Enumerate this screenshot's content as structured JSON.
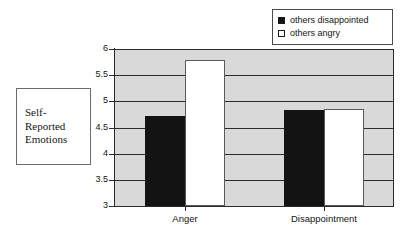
{
  "axis_title": {
    "text": "Self-\nReported\nEmotions"
  },
  "legend": {
    "items": [
      {
        "label": "others disappointed",
        "swatch": "filled-square-icon",
        "color": "#131313"
      },
      {
        "label": "others angry",
        "swatch": "hollow-square-icon",
        "color": "#ffffff"
      }
    ]
  },
  "colors": {
    "plot_background": "#d9d9d9",
    "axis": "#2b2b2b",
    "series_dark": "#131313",
    "series_light": "#ffffff",
    "page_background": "#ffffff"
  },
  "chart_data": {
    "type": "bar",
    "title": "",
    "xlabel": "",
    "ylabel": "Self-Reported Emotions",
    "categories": [
      "Anger",
      "Disappointment"
    ],
    "series": [
      {
        "name": "others disappointed",
        "values": [
          4.72,
          4.84
        ]
      },
      {
        "name": "others angry",
        "values": [
          5.79,
          4.86
        ]
      }
    ],
    "ylim": [
      3,
      6
    ],
    "yticks": [
      "3",
      "3.5",
      "4",
      "4.5",
      "5",
      "5.5",
      "6"
    ],
    "ytick_values": [
      3,
      3.5,
      4,
      4.5,
      5,
      5.5,
      6
    ],
    "grid": true,
    "grid_axis": "y",
    "legend_position": "top-right"
  }
}
